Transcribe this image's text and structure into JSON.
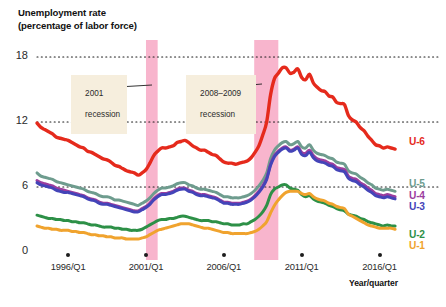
{
  "chart_data": {
    "type": "line",
    "title": "Unemployment rate\n(percentage of labor force)",
    "xlabel": "Year/quarter",
    "ylabel": "Unemployment rate (percentage of labor force)",
    "ylim": [
      0,
      19
    ],
    "yticks": [
      0,
      6,
      12,
      18
    ],
    "ytick_labels": [
      "0",
      "6",
      "12",
      "18"
    ],
    "xlim": [
      1994.0,
      2017.25
    ],
    "xticks": [
      1996,
      2001,
      2006,
      2011,
      2016
    ],
    "xtick_labels": [
      "1996/Q1",
      "2001/Q1",
      "2006/Q1",
      "2011/Q1",
      "2016/Q1"
    ],
    "grid": "horizontal-dotted",
    "legend_position": "right-inline",
    "annotations": [
      {
        "text": "2001\nrecession",
        "label_line1": "2001",
        "label_line2": "recession",
        "points_to": 2001.2
      },
      {
        "text": "2008–2009\nrecession",
        "label_line1": "2008–2009",
        "label_line2": "recession",
        "points_to": 2008.8
      }
    ],
    "shaded_bands": [
      {
        "name": "2001 recession",
        "x0": 2001.0,
        "x1": 2001.75,
        "color": "#f7a8c4"
      },
      {
        "name": "2008-2009 recession",
        "x0": 2007.95,
        "x1": 2009.5,
        "color": "#f7a8c4"
      }
    ],
    "x": [
      1994.0,
      1994.25,
      1994.5,
      1994.75,
      1995.0,
      1995.25,
      1995.5,
      1995.75,
      1996.0,
      1996.25,
      1996.5,
      1996.75,
      1997.0,
      1997.25,
      1997.5,
      1997.75,
      1998.0,
      1998.25,
      1998.5,
      1998.75,
      1999.0,
      1999.25,
      1999.5,
      1999.75,
      2000.0,
      2000.25,
      2000.5,
      2000.75,
      2001.0,
      2001.25,
      2001.5,
      2001.75,
      2002.0,
      2002.25,
      2002.5,
      2002.75,
      2003.0,
      2003.25,
      2003.5,
      2003.75,
      2004.0,
      2004.25,
      2004.5,
      2004.75,
      2005.0,
      2005.25,
      2005.5,
      2005.75,
      2006.0,
      2006.25,
      2006.5,
      2006.75,
      2007.0,
      2007.25,
      2007.5,
      2007.75,
      2008.0,
      2008.25,
      2008.5,
      2008.75,
      2009.0,
      2009.25,
      2009.5,
      2009.75,
      2010.0,
      2010.25,
      2010.5,
      2010.75,
      2011.0,
      2011.25,
      2011.5,
      2011.75,
      2012.0,
      2012.25,
      2012.5,
      2012.75,
      2013.0,
      2013.25,
      2013.5,
      2013.75,
      2014.0,
      2014.25,
      2014.5,
      2014.75,
      2015.0,
      2015.25,
      2015.5,
      2015.75,
      2016.0,
      2016.25,
      2016.5,
      2016.75,
      2017.0
    ],
    "series": [
      {
        "name": "U-6",
        "label": "U-6",
        "color": "#e52a1c",
        "values": [
          11.9,
          11.5,
          11.3,
          11.1,
          10.9,
          10.6,
          10.5,
          10.4,
          10.3,
          10.1,
          9.9,
          9.7,
          9.6,
          9.3,
          9.2,
          9.0,
          8.8,
          8.6,
          8.5,
          8.3,
          8.0,
          7.9,
          7.7,
          7.5,
          7.4,
          7.3,
          7.1,
          7.3,
          7.6,
          8.2,
          8.9,
          9.3,
          9.6,
          9.6,
          9.7,
          9.8,
          10.1,
          10.2,
          10.3,
          10.1,
          9.8,
          9.6,
          9.4,
          9.4,
          9.2,
          9.0,
          8.9,
          8.6,
          8.3,
          8.2,
          8.2,
          8.1,
          8.2,
          8.3,
          8.4,
          8.7,
          9.2,
          9.8,
          10.8,
          12.0,
          14.5,
          16.0,
          16.5,
          17.0,
          17.0,
          16.5,
          16.6,
          16.9,
          16.1,
          15.9,
          16.4,
          15.6,
          15.2,
          14.9,
          14.8,
          14.4,
          14.3,
          13.8,
          13.7,
          13.6,
          12.6,
          12.2,
          12.0,
          11.5,
          11.2,
          10.7,
          10.3,
          9.9,
          9.8,
          9.6,
          9.7,
          9.6,
          9.5
        ],
        "final_value": 9.5,
        "peak_value": 17.2,
        "peak_year": "2010"
      },
      {
        "name": "U-5",
        "label": "U-5",
        "color": "#6e9c8e",
        "values": [
          7.3,
          7.0,
          6.9,
          6.8,
          6.7,
          6.5,
          6.4,
          6.3,
          6.2,
          6.1,
          6.0,
          5.9,
          5.8,
          5.6,
          5.5,
          5.4,
          5.2,
          5.1,
          5.1,
          5.0,
          4.8,
          4.8,
          4.7,
          4.6,
          4.5,
          4.4,
          4.3,
          4.5,
          4.7,
          5.0,
          5.4,
          5.7,
          5.9,
          5.9,
          6.0,
          6.1,
          6.3,
          6.4,
          6.4,
          6.2,
          6.1,
          5.9,
          5.8,
          5.8,
          5.7,
          5.6,
          5.5,
          5.3,
          5.1,
          5.1,
          5.0,
          5.0,
          5.0,
          5.1,
          5.2,
          5.4,
          5.7,
          6.1,
          6.6,
          7.3,
          8.6,
          9.4,
          9.8,
          10.1,
          10.2,
          9.9,
          10.0,
          10.2,
          9.7,
          9.6,
          9.9,
          9.4,
          9.1,
          9.0,
          8.9,
          8.7,
          8.6,
          8.3,
          8.2,
          8.1,
          7.5,
          7.3,
          7.2,
          6.9,
          6.7,
          6.4,
          6.2,
          5.9,
          5.8,
          5.7,
          5.8,
          5.7,
          5.6
        ],
        "final_value": 5.6
      },
      {
        "name": "U-4",
        "label": "U-4",
        "color": "#9b3d9e",
        "values": [
          6.6,
          6.4,
          6.3,
          6.2,
          6.1,
          5.9,
          5.8,
          5.7,
          5.6,
          5.5,
          5.4,
          5.3,
          5.2,
          5.0,
          4.9,
          4.8,
          4.6,
          4.5,
          4.5,
          4.4,
          4.3,
          4.2,
          4.1,
          4.0,
          3.9,
          3.8,
          3.8,
          4.0,
          4.2,
          4.5,
          4.9,
          5.2,
          5.4,
          5.4,
          5.5,
          5.6,
          5.8,
          5.9,
          5.9,
          5.7,
          5.6,
          5.4,
          5.3,
          5.3,
          5.2,
          5.1,
          5.0,
          4.8,
          4.6,
          4.6,
          4.5,
          4.5,
          4.5,
          4.6,
          4.7,
          4.9,
          5.2,
          5.6,
          6.1,
          6.8,
          8.1,
          8.9,
          9.3,
          9.6,
          9.7,
          9.4,
          9.5,
          9.7,
          9.2,
          9.1,
          9.4,
          8.9,
          8.6,
          8.5,
          8.4,
          8.2,
          8.1,
          7.8,
          7.7,
          7.6,
          7.0,
          6.8,
          6.7,
          6.4,
          6.2,
          5.9,
          5.7,
          5.4,
          5.3,
          5.2,
          5.3,
          5.2,
          5.1
        ],
        "final_value": 5.1
      },
      {
        "name": "U-3",
        "label": "U-3",
        "color": "#4444b8",
        "values": [
          6.4,
          6.2,
          6.1,
          6.0,
          5.9,
          5.7,
          5.6,
          5.5,
          5.5,
          5.4,
          5.3,
          5.2,
          5.1,
          4.9,
          4.8,
          4.7,
          4.5,
          4.4,
          4.4,
          4.3,
          4.2,
          4.1,
          4.0,
          3.9,
          3.8,
          3.7,
          3.7,
          3.9,
          4.1,
          4.4,
          4.8,
          5.1,
          5.3,
          5.3,
          5.4,
          5.5,
          5.7,
          5.8,
          5.8,
          5.6,
          5.5,
          5.3,
          5.2,
          5.2,
          5.1,
          5.0,
          4.9,
          4.7,
          4.5,
          4.5,
          4.4,
          4.4,
          4.4,
          4.5,
          4.6,
          4.8,
          5.1,
          5.5,
          6.0,
          6.7,
          8.0,
          8.8,
          9.2,
          9.5,
          9.6,
          9.3,
          9.4,
          9.6,
          9.0,
          8.9,
          9.2,
          8.7,
          8.4,
          8.3,
          8.2,
          8.0,
          7.9,
          7.6,
          7.5,
          7.4,
          6.8,
          6.6,
          6.5,
          6.2,
          6.0,
          5.7,
          5.5,
          5.2,
          5.1,
          5.0,
          5.1,
          5.0,
          4.9
        ],
        "final_value": 4.9
      },
      {
        "name": "U-2",
        "label": "U-2",
        "color": "#2d9047",
        "values": [
          3.4,
          3.3,
          3.2,
          3.1,
          3.1,
          3.0,
          3.0,
          2.9,
          2.9,
          2.8,
          2.8,
          2.7,
          2.7,
          2.6,
          2.5,
          2.5,
          2.4,
          2.3,
          2.3,
          2.3,
          2.2,
          2.2,
          2.1,
          2.1,
          2.0,
          2.0,
          2.0,
          2.1,
          2.3,
          2.5,
          2.7,
          2.9,
          3.0,
          3.0,
          3.1,
          3.1,
          3.2,
          3.3,
          3.3,
          3.2,
          3.1,
          3.0,
          2.9,
          2.9,
          2.9,
          2.8,
          2.8,
          2.7,
          2.6,
          2.6,
          2.5,
          2.5,
          2.5,
          2.6,
          2.6,
          2.8,
          3.0,
          3.3,
          3.7,
          4.3,
          5.3,
          5.8,
          6.0,
          6.2,
          6.2,
          5.9,
          5.8,
          5.7,
          5.3,
          5.1,
          5.2,
          4.9,
          4.7,
          4.6,
          4.5,
          4.3,
          4.2,
          4.0,
          3.9,
          3.8,
          3.5,
          3.4,
          3.3,
          3.1,
          3.0,
          2.8,
          2.7,
          2.6,
          2.5,
          2.4,
          2.5,
          2.4,
          2.4
        ],
        "final_value": 2.4
      },
      {
        "name": "U-1",
        "label": "U-1",
        "color": "#f0a32e",
        "values": [
          2.4,
          2.3,
          2.2,
          2.2,
          2.1,
          2.1,
          2.0,
          2.0,
          2.0,
          1.9,
          1.9,
          1.8,
          1.8,
          1.7,
          1.6,
          1.6,
          1.5,
          1.5,
          1.4,
          1.4,
          1.3,
          1.3,
          1.3,
          1.2,
          1.2,
          1.2,
          1.2,
          1.3,
          1.4,
          1.6,
          1.8,
          2.0,
          2.1,
          2.2,
          2.3,
          2.4,
          2.5,
          2.6,
          2.6,
          2.6,
          2.5,
          2.4,
          2.3,
          2.2,
          2.2,
          2.1,
          2.0,
          1.9,
          1.8,
          1.8,
          1.7,
          1.7,
          1.7,
          1.7,
          1.7,
          1.8,
          1.9,
          2.1,
          2.4,
          2.8,
          3.6,
          4.3,
          4.8,
          5.2,
          5.5,
          5.6,
          5.6,
          5.6,
          5.4,
          5.3,
          5.4,
          5.1,
          4.9,
          4.8,
          4.7,
          4.5,
          4.4,
          4.2,
          4.1,
          4.0,
          3.5,
          3.3,
          3.1,
          2.9,
          2.7,
          2.5,
          2.4,
          2.3,
          2.2,
          2.2,
          2.2,
          2.2,
          2.1
        ],
        "final_value": 2.1
      }
    ]
  },
  "colors": {
    "u6": "#e52a1c",
    "u5": "#6e9c8e",
    "u4": "#9b3d9e",
    "u3": "#4444b8",
    "u2": "#2d9047",
    "u1": "#f0a32e",
    "recession_band": "#f7a8c4",
    "annotation_bg": "#f6eedd",
    "gridline": "#1a1a1a",
    "text": "#1d1d1d"
  }
}
